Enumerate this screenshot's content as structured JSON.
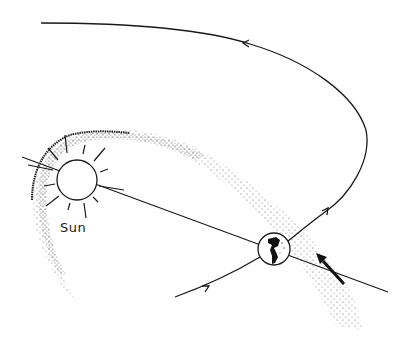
{
  "diagram": {
    "colors": {
      "ink": "#1a1a1a",
      "background": "#ffffff",
      "stipple": "#333333"
    },
    "labels": {
      "sun": "Sun"
    },
    "elements": {
      "sun": {
        "cx": 77,
        "cy": 180,
        "r": 20,
        "rays": 14
      },
      "earth": {
        "cx": 274,
        "cy": 249,
        "r": 16
      },
      "sun_earth_line": {
        "from": [
          22,
          157
        ],
        "to": [
          388,
          292
        ]
      },
      "orbit_arrows": [
        {
          "position": [
            245,
            43
          ],
          "direction": "left"
        },
        {
          "position": [
            327,
            211
          ],
          "direction": "up-right"
        },
        {
          "position": [
            208,
            287
          ],
          "direction": "up-right"
        }
      ],
      "motion_arrow": {
        "from": [
          344,
          284
        ],
        "to": [
          318,
          256
        ]
      }
    }
  }
}
